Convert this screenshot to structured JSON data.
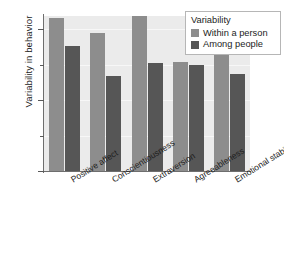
{
  "chart_data": {
    "type": "bar",
    "title": "",
    "xlabel": "",
    "ylabel": "Variability in behavior",
    "categories": [
      "Positive affect",
      "Conscientiousness",
      "Extraversion",
      "Agreeableness",
      "Emotional stability"
    ],
    "series": [
      {
        "name": "Within a person",
        "color": "#8d8d8d",
        "values": [
          1.08,
          0.97,
          1.09,
          0.77,
          0.83
        ]
      },
      {
        "name": "Among people",
        "color": "#565656",
        "values": [
          0.88,
          0.67,
          0.76,
          0.75,
          0.68
        ]
      }
    ],
    "ylim": [
      0,
      1.16
    ],
    "yticks": [
      0,
      0.5,
      1
    ],
    "ytick_labels": [
      "0",
      "0.5",
      "1"
    ],
    "yticks_minor": [
      0.25,
      0.75
    ],
    "grid": true,
    "grid_axis": "y",
    "legend": {
      "title": "Variability",
      "position": "top-right",
      "entries": [
        "Within a person",
        "Among people"
      ]
    },
    "plot_background": "#ebebeb",
    "figure_background": "#ffffff"
  }
}
